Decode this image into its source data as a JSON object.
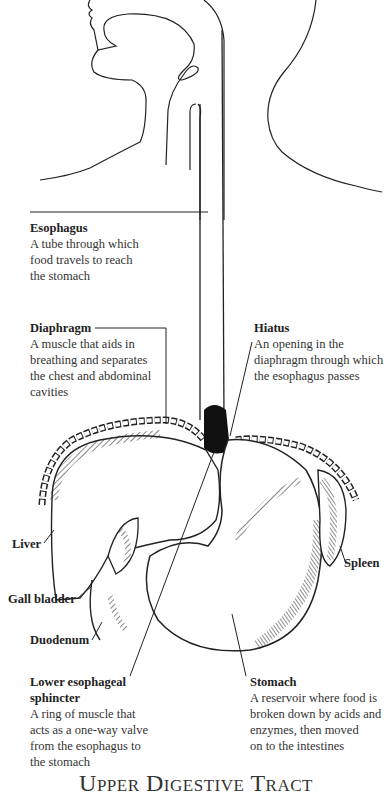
{
  "title": "Upper Digestive Tract",
  "labels": {
    "esophagus": {
      "term": "Esophagus",
      "desc": [
        "A tube through which",
        "food travels to reach",
        "the stomach"
      ]
    },
    "diaphragm": {
      "term": "Diaphragm",
      "desc": [
        "A muscle that aids in",
        "breathing and separates",
        "the chest and abdominal",
        "cavities"
      ]
    },
    "hiatus": {
      "term": "Hiatus",
      "desc": [
        "An opening in the",
        "diaphragm through which",
        "the esophagus passes"
      ]
    },
    "liver": {
      "term": "Liver"
    },
    "gall_bladder": {
      "term": "Gall bladder"
    },
    "duodenum": {
      "term": "Duodenum"
    },
    "spleen": {
      "term": "Spleen"
    },
    "les": {
      "term": "Lower esophageal sphincter",
      "term_lines": [
        "Lower esophageal",
        "sphincter"
      ],
      "desc": [
        "A ring of muscle that",
        "acts as a one-way valve",
        "from the esophagus to",
        "the stomach"
      ]
    },
    "stomach": {
      "term": "Stomach",
      "desc": [
        "A reservoir where food is",
        "broken down by acids and",
        "enzymes, then moved",
        "on to the intestines"
      ]
    }
  },
  "colors": {
    "ink": "#222222",
    "background": "#ffffff"
  }
}
